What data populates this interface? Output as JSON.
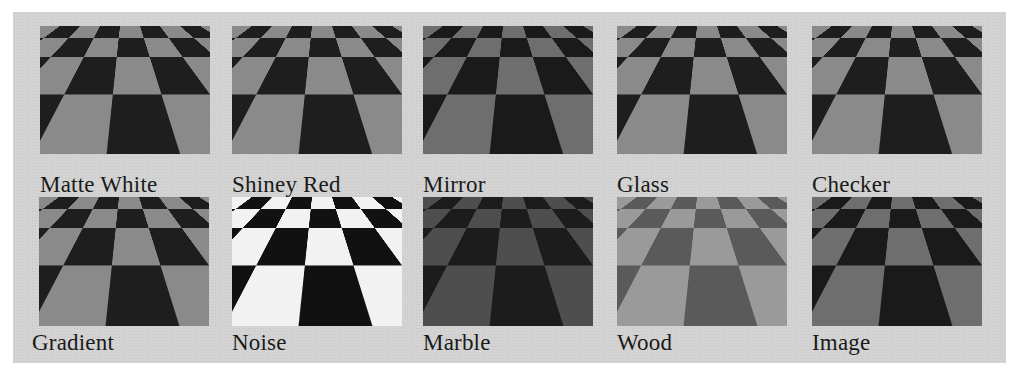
{
  "figure": {
    "panel_color": "#d3d3d3",
    "rows": [
      {
        "items": [
          {
            "label": "Matte White",
            "material": "matte-white"
          },
          {
            "label": "Shiney Red",
            "material": "shiney-red"
          },
          {
            "label": "Mirror",
            "material": "mirror"
          },
          {
            "label": "Glass",
            "material": "glass"
          },
          {
            "label": "Checker",
            "material": "checker"
          }
        ]
      },
      {
        "items": [
          {
            "label": "Gradient",
            "material": "gradient"
          },
          {
            "label": "Noise",
            "material": "noise"
          },
          {
            "label": "Marble",
            "material": "marble"
          },
          {
            "label": "Wood",
            "material": "wood"
          },
          {
            "label": "Image",
            "material": "image"
          }
        ]
      }
    ]
  }
}
